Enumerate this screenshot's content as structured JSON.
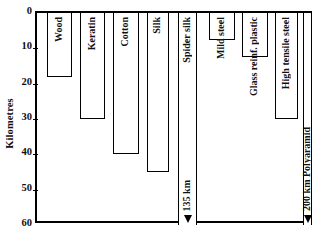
{
  "chart_data": {
    "type": "bar",
    "orientation": "vertical-downward",
    "title": "",
    "xlabel": "",
    "ylabel": "Kilometres",
    "ylim": [
      0,
      60
    ],
    "yticks": [
      0,
      10,
      20,
      30,
      40,
      50,
      60
    ],
    "grid": false,
    "legend": "none",
    "categories": [
      "Wood",
      "Keratin",
      "Cotton",
      "Silk",
      "Spider silk",
      "Mild steel",
      "Glass reinf. plastic",
      "High tensile steel",
      "Polyaramid"
    ],
    "values": [
      18,
      30,
      40,
      45,
      135,
      7.5,
      12.5,
      30,
      200
    ],
    "value_units": "km",
    "offscale_annotations": [
      {
        "category": "Spider silk",
        "label": "135 km"
      },
      {
        "category": "Polyaramid",
        "label": "200 km Polyaramid"
      }
    ]
  },
  "axis": {
    "ylabel": "Kilometres",
    "ticks": [
      {
        "label": "0",
        "value": 0
      },
      {
        "label": "10",
        "value": 10
      },
      {
        "label": "20",
        "value": 20
      },
      {
        "label": "30",
        "value": 30
      },
      {
        "label": "40",
        "value": 40
      },
      {
        "label": "50",
        "value": 50
      },
      {
        "label": "60",
        "value": 60
      }
    ]
  },
  "bars": [
    {
      "name": "Wood",
      "label": "Wood",
      "value": 18,
      "clipped": false,
      "annotation": ""
    },
    {
      "name": "Keratin",
      "label": "Keratin",
      "value": 30,
      "clipped": false,
      "annotation": ""
    },
    {
      "name": "Cotton",
      "label": "Cotton",
      "value": 40,
      "clipped": false,
      "annotation": ""
    },
    {
      "name": "Silk",
      "label": "Silk",
      "value": 45,
      "clipped": false,
      "annotation": ""
    },
    {
      "name": "Spider silk",
      "label": "Spider silk",
      "value": 135,
      "clipped": true,
      "annotation": "135 km"
    },
    {
      "name": "Mild steel",
      "label": "Mild steel",
      "value": 7.5,
      "clipped": false,
      "annotation": ""
    },
    {
      "name": "Glass reinf. plastic",
      "label": "Glass reinf. plastic",
      "value": 12.5,
      "clipped": false,
      "annotation": ""
    },
    {
      "name": "High tensile steel",
      "label": "High tensile steel",
      "value": 30,
      "clipped": false,
      "annotation": ""
    },
    {
      "name": "Polyaramid",
      "label": "",
      "value": 200,
      "clipped": true,
      "annotation": "200 km Polyaramid"
    }
  ],
  "colors": {
    "background": "#ffffff",
    "ink": "#000000",
    "bar_fill": "#ffffff"
  }
}
